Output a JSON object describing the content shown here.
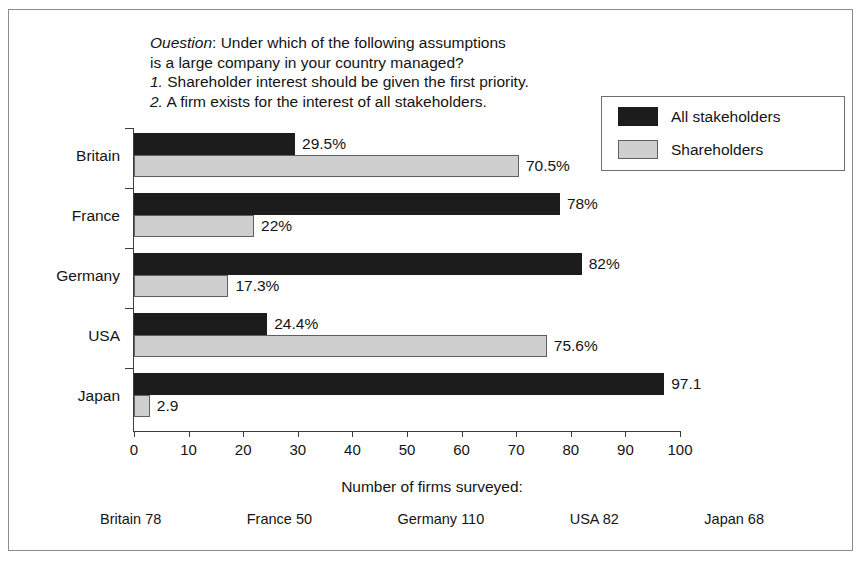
{
  "figure": {
    "width": 864,
    "height": 564,
    "background": "#ffffff",
    "frame_color": "#8c8c8c"
  },
  "question": {
    "label": "Ouestion",
    "colon": ":",
    "line1_rest": " Under which of the following assumptions",
    "line2": "is a large company in your country managed?",
    "item1_num": "1.",
    "item1_text": " Shareholder interest should be given the first priority.",
    "item2_num": "2.",
    "item2_text": " A firm exists for the interest of all stakeholders."
  },
  "legend": {
    "position": "top-right",
    "entries": [
      {
        "label": "All stakeholders",
        "color": "#1c1c1c",
        "swatch": "black-swatch"
      },
      {
        "label": "Shareholders",
        "color": "#cfcfcf",
        "swatch": "gray-swatch"
      }
    ]
  },
  "axis_caption": "Number of firms surveyed:",
  "survey_counts": [
    "Britain 78",
    "France 50",
    "Germany 110",
    "USA 82",
    "Japan 68"
  ],
  "chart_data": {
    "type": "bar",
    "orientation": "horizontal",
    "title": "",
    "subtitle": "",
    "xlabel": "Number of firms surveyed:",
    "ylabel": "",
    "xlim": [
      0,
      100
    ],
    "xticks": [
      0,
      10,
      20,
      30,
      40,
      50,
      60,
      70,
      80,
      90,
      100
    ],
    "xtick_labels": [
      "0",
      "10",
      "20",
      "30",
      "40",
      "50",
      "60",
      "70",
      "80",
      "90",
      "100"
    ],
    "grid": false,
    "legend_position": "top-right",
    "categories": [
      "Britain",
      "France",
      "Germany",
      "USA",
      "Japan"
    ],
    "series": [
      {
        "name": "All stakeholders",
        "color": "#1c1c1c",
        "values": [
          29.5,
          78,
          82,
          24.4,
          97.1
        ],
        "labels": [
          "29.5%",
          "78%",
          "82%",
          "24.4%",
          "97.1"
        ]
      },
      {
        "name": "Shareholders",
        "color": "#cfcfcf",
        "values": [
          70.5,
          22,
          17.3,
          75.6,
          2.9
        ],
        "labels": [
          "70.5%",
          "22%",
          "17.3%",
          "75.6%",
          "2.9"
        ]
      }
    ],
    "survey_sizes": {
      "Britain": 78,
      "France": 50,
      "Germany": 110,
      "USA": 82,
      "Japan": 68
    }
  }
}
